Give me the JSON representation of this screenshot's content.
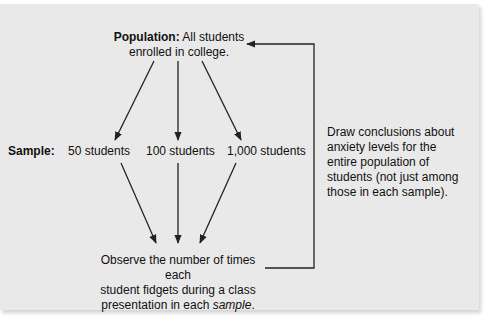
{
  "diagram": {
    "population": {
      "label": "Population:",
      "text_line1": " All students",
      "text_line2": "enrolled in college."
    },
    "sample": {
      "label": "Sample:",
      "sizes": [
        "50 students",
        "100 students",
        "1,000 students"
      ]
    },
    "observe": {
      "line1": "Observe the number of times each",
      "line2": "student fidgets during a class",
      "line3_prefix": "presentation in each ",
      "line3_italic": "sample",
      "line3_suffix": "."
    },
    "conclusion": {
      "lines": [
        "Draw conclusions about",
        "anxiety levels for the",
        "entire population of",
        "students (not just among",
        "those in each sample)."
      ]
    },
    "colors": {
      "panel_background": "#e9e9e9",
      "line_color": "#222222",
      "text_color": "#111111"
    }
  }
}
